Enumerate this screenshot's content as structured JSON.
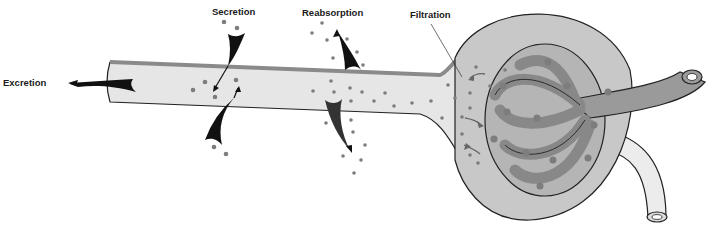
{
  "diagram": {
    "labels": {
      "excretion": "Excretion",
      "secretion": "Secretion",
      "reabsorption": "Reabsorption",
      "filtration": "Filtration"
    },
    "colors": {
      "tubule_fill": "#e6e6e6",
      "tubule_wall": "#8a8a8a",
      "capsule_fill": "#bdbdbd",
      "capillary": "#9a9a9a",
      "vessel_light": "#ececec",
      "particle": "#808080",
      "arrow": "#111111",
      "outline": "#222222"
    }
  }
}
